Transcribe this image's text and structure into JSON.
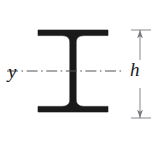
{
  "figure": {
    "type": "engineering-cross-section-diagram",
    "background_color": "#ffffff",
    "ink_color": "#1a1a1a",
    "centerline_color": "#55555a"
  },
  "labels": {
    "axis_y": "y",
    "dimension_h": "h"
  },
  "annotations": {
    "centroidal_axis_name": "y",
    "centroidal_axis_style": "dash-dot",
    "height_dimension_name": "h",
    "height_dimension_side": "right",
    "arrowheads": "both-ends"
  },
  "geometry": {
    "flange_left_x": 38,
    "flange_right_x": 108,
    "top_flange_y": 30,
    "top_flange_thickness": 6,
    "bottom_flange_y": 112,
    "bottom_flange_thickness": 6,
    "web_center_x": 73,
    "web_thickness": 6,
    "centerline_y": 71,
    "centerline_left_x": 6,
    "centerline_right_x": 124,
    "dimension_line_x": 140,
    "dimension_top_y": 30,
    "dimension_bottom_y": 118,
    "extension_line_left_x": 131,
    "extension_line_right_x": 151
  }
}
